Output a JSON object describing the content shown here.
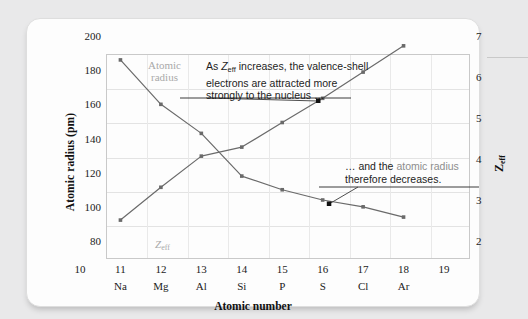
{
  "chart_data": {
    "type": "line",
    "title": "",
    "xlabel": "Atomic number",
    "ylabel": "Atomic radius (pm)",
    "y2label": "Zeff",
    "xlim": [
      10,
      19
    ],
    "ylim": [
      80,
      200
    ],
    "y2lim": [
      2,
      7
    ],
    "grid": true,
    "legend_position": "inline-labels",
    "x": [
      11,
      12,
      13,
      14,
      15,
      16,
      17,
      18
    ],
    "element_symbols": [
      "Na",
      "Mg",
      "Al",
      "Si",
      "P",
      "S",
      "Cl",
      "Ar"
    ],
    "x_tick_labels": [
      "10",
      "11",
      "12",
      "13",
      "14",
      "15",
      "16",
      "17",
      "18",
      "19"
    ],
    "y_tick_labels": [
      "80",
      "100",
      "120",
      "140",
      "160",
      "180",
      "200"
    ],
    "y2_tick_labels": [
      "2",
      "3",
      "4",
      "5",
      "6",
      "7"
    ],
    "series": [
      {
        "name": "Atomic radius",
        "axis": "left",
        "units": "pm",
        "values": [
          186,
          160,
          143,
          118,
          110,
          104,
          100,
          94
        ]
      },
      {
        "name": "Zeff",
        "axis": "right",
        "units": "",
        "values": [
          2.51,
          3.31,
          4.07,
          4.29,
          4.89,
          5.48,
          6.12,
          6.76
        ]
      }
    ],
    "annotations": [
      {
        "id": "callout-1",
        "text": "As Zeff increases, the valence-shell electrons are attracted more strongly to the nucleus …",
        "lines": [
          "As Zeff increases, the valence-shell",
          "electrons are attracted more",
          "strongly to the nucleus …"
        ],
        "points_to_series": "Zeff"
      },
      {
        "id": "callout-2",
        "text": "… and the atomic radius therefore decreases.",
        "lines": [
          "… and the atomic radius",
          "therefore decreases."
        ],
        "points_to_series": "Atomic radius"
      }
    ]
  },
  "axes": {
    "y_left": {
      "title": "Atomic radius (pm)",
      "ticks": [
        "200",
        "180",
        "160",
        "140",
        "120",
        "100",
        "80"
      ]
    },
    "y_right": {
      "title_base": "Z",
      "title_sub": "eff",
      "ticks": [
        "7",
        "6",
        "5",
        "4",
        "3",
        "2"
      ]
    },
    "x": {
      "title": "Atomic number",
      "numbers": [
        "10",
        "11",
        "12",
        "13",
        "14",
        "15",
        "16",
        "17",
        "18",
        "19"
      ],
      "symbols": [
        "",
        "Na",
        "Mg",
        "Al",
        "Si",
        "P",
        "S",
        "Cl",
        "Ar",
        ""
      ]
    }
  },
  "series_labels": {
    "radius_line1": "Atomic",
    "radius_line2": "radius",
    "zeff_base": "Z",
    "zeff_sub": "eff"
  },
  "callouts": {
    "first": {
      "a": "As ",
      "z": "Z",
      "zsub": "eff",
      "b": " increases, the valence-shell",
      "line2": "electrons are attracted more",
      "line3": "strongly to the nucleus …"
    },
    "second": {
      "a": "… and the ",
      "highlight": "atomic radius",
      "line2": "therefore decreases."
    }
  },
  "colors": {
    "series_line": "#6a6a6a",
    "grid": "#e3e3e3",
    "frame": "#c9c9c9",
    "label_grey": "#a9a9a9",
    "text": "#1b1b1b",
    "card": "#fdfdfd",
    "page_background": "#e9e9ea",
    "callout_highlight": "#8d8d8d"
  }
}
